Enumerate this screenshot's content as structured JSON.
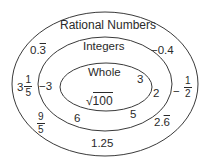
{
  "diagram": {
    "sets": [
      {
        "id": "rational",
        "label": "Rational Numbers"
      },
      {
        "id": "integers",
        "label": "Integers"
      },
      {
        "id": "whole",
        "label": "Whole"
      }
    ],
    "whole_members": {
      "three": "3",
      "sqrt_symbol": "√",
      "sqrt_radicand": "100"
    },
    "integer_members": {
      "neg_three": "−3",
      "two": "2",
      "six": "6",
      "five": "5"
    },
    "rational_members": {
      "zero_point_three_whole": "0.",
      "zero_point_three_repeat": "3",
      "neg_zero_point_four": "−0.4",
      "three_and_fifth_whole": "3",
      "three_and_fifth_num": "1",
      "three_and_fifth_den": "5",
      "neg_half_sign": "−",
      "neg_half_num": "1",
      "neg_half_den": "2",
      "nine_fifths_num": "9",
      "nine_fifths_den": "5",
      "two_point_six_whole": "2.",
      "two_point_six_repeat": "6",
      "one_point_two_five": "1.25"
    },
    "stroke_color": "#3a3a3a"
  }
}
